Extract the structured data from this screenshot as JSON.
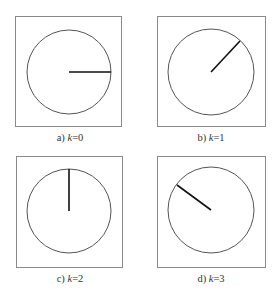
{
  "figure": {
    "panels": [
      {
        "id": "a",
        "prefix": "a)",
        "var": "k",
        "eq": "=0",
        "angle_deg": 0
      },
      {
        "id": "b",
        "prefix": "b)",
        "var": "k",
        "eq": "=1",
        "angle_deg": 45
      },
      {
        "id": "c",
        "prefix": "c)",
        "var": "k",
        "eq": "=2",
        "angle_deg": 90
      },
      {
        "id": "d",
        "prefix": "d)",
        "var": "k",
        "eq": "=3",
        "angle_deg": 145
      }
    ]
  },
  "colors": {
    "frame": "#8a8a8a",
    "circle": "#555555",
    "hand": "#111111",
    "text": "#333333"
  }
}
